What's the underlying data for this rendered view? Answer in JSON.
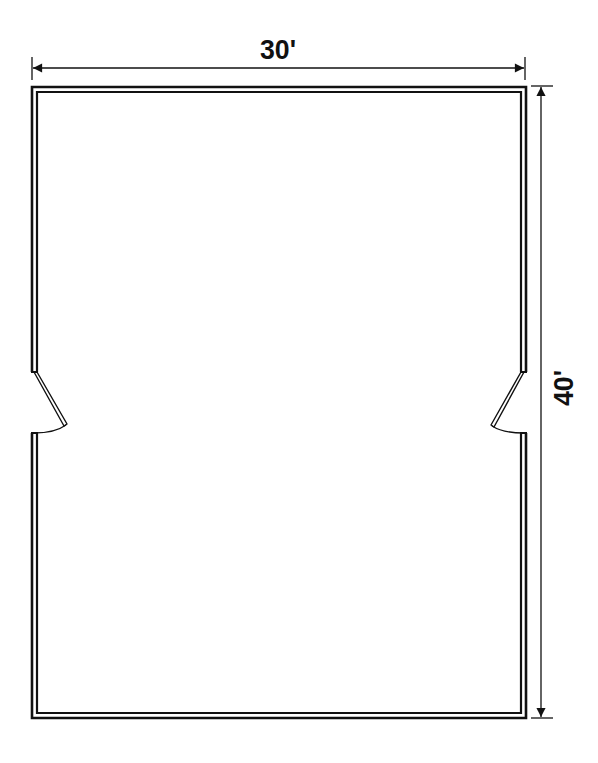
{
  "diagram": {
    "type": "floor-plan",
    "room": {
      "width_label": "30'",
      "height_label": "40'"
    },
    "doors": [
      {
        "side": "left",
        "position": "middle"
      },
      {
        "side": "right",
        "position": "middle"
      }
    ],
    "colors": {
      "line": "#111111",
      "background": "#ffffff"
    }
  }
}
